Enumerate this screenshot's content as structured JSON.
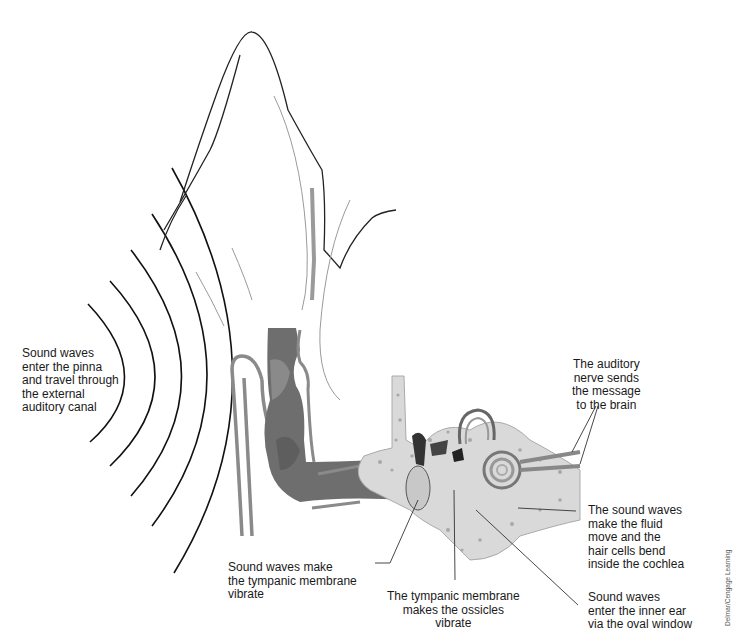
{
  "diagram": {
    "colors": {
      "canal_dark": "#6e6e6e",
      "canal_mid": "#8a8a8a",
      "bone": "#d9d9d9",
      "bone_spots": "#a8a8a8",
      "outline": "#222222",
      "skin_line": "#9a9a9a"
    },
    "labels": {
      "pinna": "Sound waves\nenter the pinna\nand travel through\nthe external\nauditory canal",
      "auditory_nerve": "The auditory\nnerve sends\nthe message\nto the brain",
      "cochlea": "The sound waves\nmake the fluid\nmove and the\nhair cells bend\ninside the cochlea",
      "tympanic": "Sound waves make\nthe tympanic membrane\nvibrate",
      "ossicles": "The tympanic membrane\nmakes the ossicles\nvibrate",
      "oval_window": "Sound waves\nenter the inner ear\nvia the oval window"
    },
    "credit": "Delmar/Cengage Learning",
    "sound_wave_count": 5
  }
}
